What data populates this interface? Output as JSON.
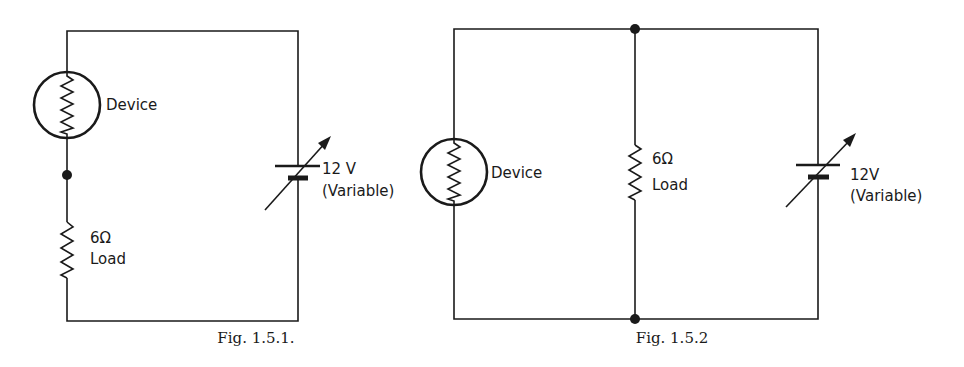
{
  "figures": [
    {
      "caption": "Fig. 1.5.1.",
      "configuration": "series",
      "device_label": "Device",
      "load_value": "6Ω",
      "load_label": "Load",
      "source_value": "12 V",
      "source_label": "(Variable)"
    },
    {
      "caption": "Fig. 1.5.2",
      "configuration": "parallel",
      "device_label": "Device",
      "load_value": "6Ω",
      "load_label": "Load",
      "source_value": "12V",
      "source_label": "(Variable)"
    }
  ],
  "colors": {
    "ink": "#1a1a1a",
    "background": "#ffffff"
  }
}
